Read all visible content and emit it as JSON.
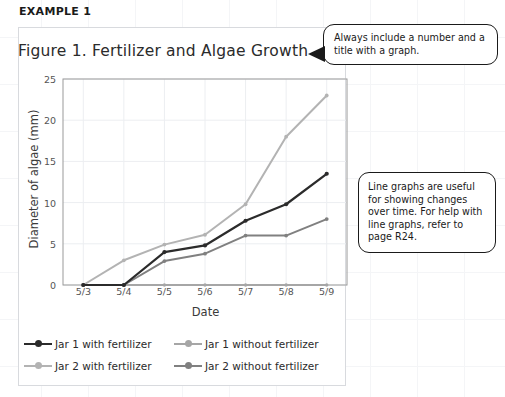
{
  "page": {
    "example_heading": "EXAMPLE 1"
  },
  "figure": {
    "title": "Figure 1. Fertilizer and Algae Growth"
  },
  "callouts": [
    {
      "name": "title-callout",
      "text": "Always include a number and a title with a graph.",
      "has_arrow": true
    },
    {
      "name": "info-callout",
      "text": "Line graphs are useful for showing changes over time. For help with line graphs, refer to page R24.",
      "has_arrow": false
    }
  ],
  "colors": {
    "series_black": "#2b2b2b",
    "series_light_gray": "#b3b3b3",
    "series_mid_gray": "#808080",
    "series_flat_gray": "#a6a6a6",
    "grid": "#eceef1",
    "axis": "#9a9a9a",
    "panel_border": "#d8dade",
    "page_grid": "#f4f5f7"
  },
  "chart_data": {
    "type": "line",
    "title": "Figure 1. Fertilizer and Algae Growth",
    "xlabel": "Date",
    "ylabel": "Diameter of algae (mm)",
    "categories": [
      "5/3",
      "5/4",
      "5/5",
      "5/6",
      "5/7",
      "5/8",
      "5/9"
    ],
    "ylim": [
      0,
      25
    ],
    "yticks": [
      0,
      5,
      10,
      15,
      20,
      25
    ],
    "grid": true,
    "legend_position": "bottom",
    "series": [
      {
        "name": "Jar 1 with fertilizer",
        "color": "#2b2b2b",
        "width": 2.2,
        "marker": 4.2,
        "values": [
          0,
          0,
          4,
          4.8,
          7.8,
          9.8,
          13.5
        ]
      },
      {
        "name": "Jar 1 without fertilizer",
        "color": "#a6a6a6",
        "width": 1.8,
        "marker": 3.4,
        "values": [
          0,
          0,
          0,
          0,
          0,
          0,
          0
        ]
      },
      {
        "name": "Jar 2 with fertilizer",
        "color": "#b3b3b3",
        "width": 2.0,
        "marker": 3.8,
        "values": [
          0,
          3,
          4.9,
          6.1,
          9.8,
          18,
          23
        ]
      },
      {
        "name": "Jar 2 without fertilizer",
        "color": "#808080",
        "width": 2.0,
        "marker": 3.8,
        "values": [
          0,
          0,
          2.9,
          3.8,
          6,
          6,
          8
        ]
      }
    ]
  }
}
